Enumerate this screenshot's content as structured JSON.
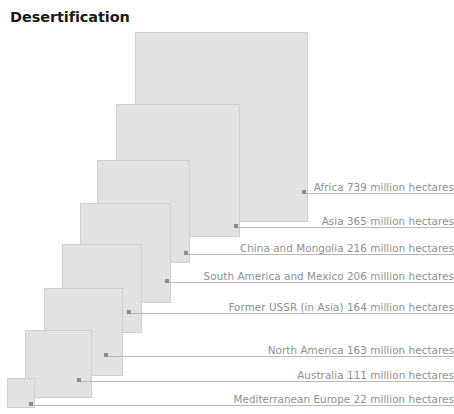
{
  "title": "Desertification",
  "units": "million hectares",
  "colors": {
    "square_fill": "#e2e2e2",
    "square_border": "#cfcfcf",
    "leader_line": "#b9b9b9",
    "dot": "#8d8d8d",
    "label_text": "#8f8f8f",
    "title_text": "#1b1b1b",
    "background": "#ffffff"
  },
  "chart_data": {
    "type": "bar",
    "subtype": "nested-proportional-squares",
    "title": "Desertification",
    "xlabel": "",
    "ylabel": "",
    "unit": "million hectares",
    "categories": [
      "Africa",
      "Asia",
      "China and Mongolia",
      "South America and Mexico",
      "Former USSR (in Asia)",
      "North America",
      "Australia",
      "Mediterranean Europe"
    ],
    "values": [
      739,
      365,
      216,
      206,
      164,
      163,
      111,
      22
    ],
    "legend_position": "right-inline-labels",
    "grid": false
  },
  "items": [
    {
      "name": "Africa",
      "value": 739,
      "label": "Africa 739 million hectares",
      "square": {
        "left": 135,
        "top": 32,
        "width": 173,
        "height": 190
      },
      "dot": {
        "x": 302,
        "y": 191
      },
      "leader": {
        "left": 306,
        "top": 193,
        "width": 148
      },
      "label_top": 181
    },
    {
      "name": "Asia",
      "value": 365,
      "label": "Asia  365 million hectares",
      "square": {
        "left": 116,
        "top": 104,
        "width": 124,
        "height": 133
      },
      "dot": {
        "x": 234,
        "y": 225
      },
      "leader": {
        "left": 238,
        "top": 227,
        "width": 216
      },
      "label_top": 215
    },
    {
      "name": "China and Mongolia",
      "value": 216,
      "label": "China and Mongolia 216 million hectares",
      "square": {
        "left": 97,
        "top": 160,
        "width": 93,
        "height": 103
      },
      "dot": {
        "x": 184,
        "y": 252
      },
      "leader": {
        "left": 188,
        "top": 254,
        "width": 266
      },
      "label_top": 242
    },
    {
      "name": "South America and Mexico",
      "value": 206,
      "label": "South America and Mexico 206 million hectares",
      "square": {
        "left": 80,
        "top": 203,
        "width": 91,
        "height": 100
      },
      "dot": {
        "x": 165,
        "y": 280
      },
      "leader": {
        "left": 169,
        "top": 282,
        "width": 285
      },
      "label_top": 270
    },
    {
      "name": "Former USSR (in Asia)",
      "value": 164,
      "label": "Former USSR (in Asia) 164 million hectares",
      "square": {
        "left": 62,
        "top": 244,
        "width": 80,
        "height": 89
      },
      "dot": {
        "x": 127,
        "y": 311
      },
      "leader": {
        "left": 131,
        "top": 313,
        "width": 323
      },
      "label_top": 301
    },
    {
      "name": "North America",
      "value": 163,
      "label": "North America 163 million hectares",
      "square": {
        "left": 44,
        "top": 288,
        "width": 79,
        "height": 88
      },
      "dot": {
        "x": 104,
        "y": 354
      },
      "leader": {
        "left": 108,
        "top": 356,
        "width": 346
      },
      "label_top": 344
    },
    {
      "name": "Australia",
      "value": 111,
      "label": "Australia 111 million hectares",
      "square": {
        "left": 25,
        "top": 330,
        "width": 67,
        "height": 68
      },
      "dot": {
        "x": 77,
        "y": 379
      },
      "leader": {
        "left": 81,
        "top": 381,
        "width": 373
      },
      "label_top": 369
    },
    {
      "name": "Mediterranean Europe",
      "value": 22,
      "label": "Mediterranean Europe 22 million hectares",
      "square": {
        "left": 7,
        "top": 378,
        "width": 28,
        "height": 30
      },
      "dot": {
        "x": 29,
        "y": 403
      },
      "leader": {
        "left": 33,
        "top": 405,
        "width": 421
      },
      "label_top": 393
    }
  ]
}
